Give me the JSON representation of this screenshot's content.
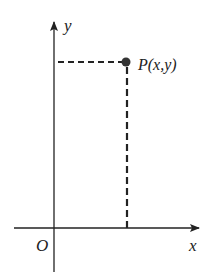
{
  "diagram": {
    "type": "coordinate-plane",
    "axes": {
      "x_label": "x",
      "y_label": "y",
      "origin_label": "O"
    },
    "point": {
      "label": "P(x,y)"
    },
    "colors": {
      "ink": "#222222",
      "background": "#ffffff"
    }
  }
}
